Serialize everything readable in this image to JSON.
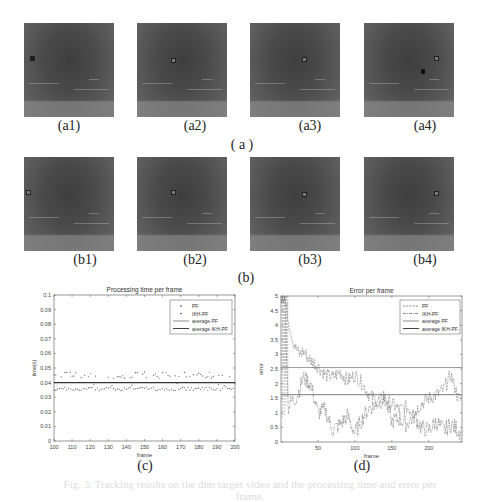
{
  "figure": {
    "row_a": {
      "images": [
        {
          "label": "(a1)"
        },
        {
          "label": "(a2)"
        },
        {
          "label": "(a3)"
        },
        {
          "label": "(a4)"
        }
      ],
      "group_label": "( a )"
    },
    "row_b": {
      "images": [
        {
          "label": "(b1)"
        },
        {
          "label": "(b2)"
        },
        {
          "label": "(b3)"
        },
        {
          "label": "(b4)"
        }
      ],
      "group_label": "(b)"
    },
    "chart_c_label": "(c)",
    "chart_d_label": "(d)"
  },
  "chart_data": [
    {
      "type": "scatter",
      "title": "Processing time per frame",
      "xlabel": "frame",
      "ylabel": "time(s)",
      "xlim": [
        100,
        200
      ],
      "ylim": [
        0,
        0.1
      ],
      "xticks": [
        100,
        110,
        120,
        130,
        140,
        150,
        160,
        170,
        180,
        190,
        200
      ],
      "yticks": [
        0,
        0.01,
        0.02,
        0.03,
        0.04,
        0.05,
        0.06,
        0.07,
        0.08,
        0.09,
        0.1
      ],
      "legend": [
        "PF",
        "IKH-PF",
        "average PF",
        "average IKH-PF"
      ],
      "legend_position": "upper right",
      "series": [
        {
          "name": "PF",
          "style": "dots",
          "approx_range": [
            0.043,
            0.049
          ],
          "mean": 0.045
        },
        {
          "name": "IKH-PF",
          "style": "dots",
          "approx_range": [
            0.033,
            0.038
          ],
          "mean": 0.035
        },
        {
          "name": "average PF",
          "style": "line",
          "value": 0.045
        },
        {
          "name": "average IKH-PF",
          "style": "line",
          "value": 0.04
        }
      ]
    },
    {
      "type": "line",
      "title": "Error per frame",
      "xlabel": "frame",
      "ylabel": "error",
      "xlim": [
        0,
        245
      ],
      "ylim": [
        0,
        5
      ],
      "xticks": [
        50,
        100,
        150,
        200
      ],
      "yticks": [
        0,
        0.5,
        1,
        1.5,
        2,
        2.5,
        3,
        3.5,
        4,
        4.5,
        5
      ],
      "legend": [
        "PF",
        "IKH-PF",
        "average PF",
        "average IKH-PF"
      ],
      "legend_position": "upper right",
      "series": [
        {
          "name": "PF",
          "style": "dashed",
          "x": [
            0,
            5,
            10,
            15,
            20,
            25,
            30,
            40,
            50,
            60,
            70,
            80,
            90,
            100,
            110,
            120,
            130,
            140,
            150,
            160,
            170,
            180,
            190,
            200,
            210,
            220,
            230,
            240,
            245
          ],
          "values": [
            5,
            5,
            4.2,
            3.6,
            3.2,
            3.0,
            3.1,
            2.8,
            2.6,
            2.3,
            2.2,
            2.4,
            2.1,
            2.3,
            2.0,
            1.6,
            1.4,
            1.5,
            1.3,
            1.1,
            1.2,
            1.0,
            1.3,
            1.5,
            1.6,
            1.8,
            2.3,
            1.5,
            1.4
          ]
        },
        {
          "name": "IKH-PF",
          "style": "dash-dot",
          "x": [
            0,
            5,
            10,
            15,
            20,
            25,
            30,
            40,
            50,
            60,
            70,
            80,
            90,
            100,
            110,
            120,
            130,
            140,
            150,
            160,
            170,
            180,
            190,
            200,
            210,
            220,
            230,
            240,
            245
          ],
          "values": [
            5,
            5,
            1.2,
            1.4,
            1.5,
            1.8,
            2.2,
            2.0,
            1.0,
            1.1,
            0.4,
            0.6,
            0.9,
            0.3,
            0.8,
            1.2,
            1.3,
            1.5,
            0.7,
            0.8,
            0.6,
            0.9,
            0.5,
            0.4,
            0.7,
            0.4,
            0.6,
            0.4,
            0.3
          ]
        },
        {
          "name": "average PF",
          "style": "line",
          "value": 2.55
        },
        {
          "name": "average IKH-PF",
          "style": "line",
          "value": 1.62
        }
      ]
    }
  ],
  "caption": "Fig. 3. Tracking results on the dim target video and the processing time and error per frame."
}
